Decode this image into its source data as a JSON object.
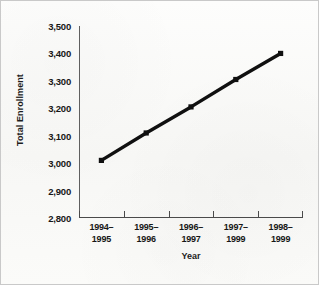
{
  "chart_data": {
    "type": "line",
    "title": "",
    "xlabel": "Year",
    "ylabel": "Total Enrollment",
    "categories": [
      "1994–1995",
      "1995–1996",
      "1996–1997",
      "1997–1999",
      "1998–1999"
    ],
    "values": [
      3010,
      3110,
      3205,
      3305,
      3400
    ],
    "ylim": [
      2800,
      3500
    ],
    "ytick_values": [
      2800,
      2900,
      3000,
      3100,
      3200,
      3300,
      3400,
      3500
    ],
    "ytick_labels": [
      "2,800",
      "2,900",
      "3,000",
      "3,100",
      "3,200",
      "3,300",
      "3,400",
      "3,500"
    ],
    "grid": false,
    "legend": false,
    "legend_position": "none",
    "marker": "square",
    "series": [
      {
        "name": "Total Enrollment",
        "values": [
          3010,
          3110,
          3205,
          3305,
          3400
        ]
      }
    ],
    "colors": {
      "line": "#101010",
      "marker": "#101010",
      "axis": "#4a4a4a",
      "text": "#161616",
      "background": "#fbfbfa",
      "border": "#c9c9c9"
    }
  }
}
